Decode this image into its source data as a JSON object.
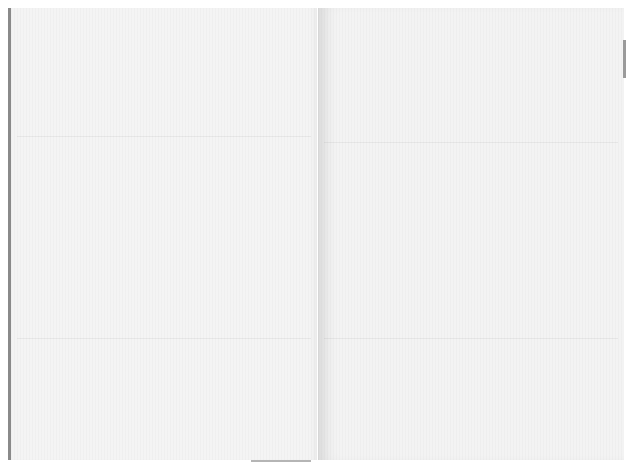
{
  "document": {
    "type": "blank open book spread",
    "pages": [
      {
        "side": "left",
        "text": ""
      },
      {
        "side": "right",
        "text": ""
      }
    ],
    "colors": {
      "paper": "#f4f4f4",
      "spine_edge": "#8a8a8a",
      "background": "#ffffff"
    }
  }
}
